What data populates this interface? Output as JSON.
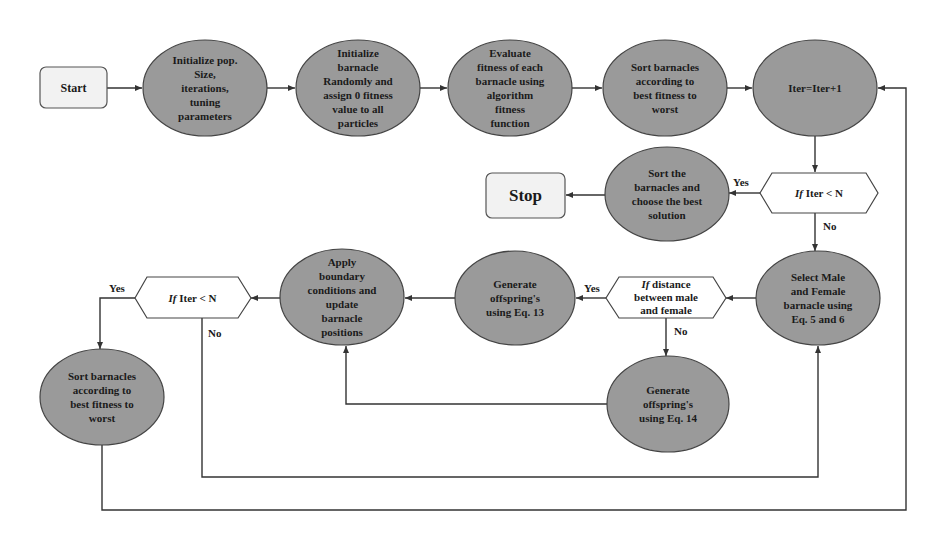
{
  "diagram": {
    "type": "flowchart",
    "colors": {
      "process_fill": "#9a9a9a",
      "terminal_fill": "#f2f2f2",
      "decision_fill": "#ffffff",
      "stroke": "#333333"
    },
    "nodes": {
      "start": {
        "label": "Start",
        "shape": "rounded-rect"
      },
      "init_pop": {
        "label": "Initialize pop.\nSize,\niterations,\ntuning\nparameters",
        "shape": "ellipse"
      },
      "init_barnacle": {
        "label": "Initialize\nbarnacle\nRandomly and\nassign 0 fitness\nvalue to all\nparticles",
        "shape": "ellipse"
      },
      "evaluate": {
        "label": "Evaluate\nfitness of each\nbarnacle using\nalgorithm\nfitness\nfunction",
        "shape": "ellipse"
      },
      "sort_top": {
        "label": "Sort barnacles\naccording to\nbest fitness to\nworst",
        "shape": "ellipse"
      },
      "iter_inc": {
        "label": "Iter=Iter+1",
        "shape": "ellipse"
      },
      "cond_top": {
        "label_prefix": "If",
        "label": " Iter < N",
        "shape": "hexagon"
      },
      "sort_best": {
        "label": "Sort the\nbarnacles and\nchoose the best\nsolution",
        "shape": "ellipse"
      },
      "stop": {
        "label": "Stop",
        "shape": "rounded-rect"
      },
      "select": {
        "label": "Select Male\nand Female\nbarnacle using\nEq. 5 and 6",
        "shape": "ellipse"
      },
      "cond_distance": {
        "label_prefix": "If",
        "label": " distance\nbetween male\nand female",
        "shape": "hexagon"
      },
      "gen13": {
        "label": "Generate\noffspring's\nusing Eq. 13",
        "shape": "ellipse"
      },
      "gen14": {
        "label": "Generate\noffspring's\nusing Eq. 14",
        "shape": "ellipse"
      },
      "boundary": {
        "label": "Apply\nboundary\nconditions and\nupdate\nbarnacle\npositions",
        "shape": "ellipse"
      },
      "cond_left": {
        "label_prefix": "If",
        "label": " Iter < N",
        "shape": "hexagon"
      },
      "sort_left": {
        "label": "Sort barnacles\naccording to\nbest fitness to\nworst",
        "shape": "ellipse"
      }
    },
    "edge_labels": {
      "top_yes": "Yes",
      "top_no": "No",
      "dist_yes": "Yes",
      "dist_no": "No",
      "left_yes": "Yes",
      "left_no": "No"
    },
    "edges": [
      {
        "from": "start",
        "to": "init_pop"
      },
      {
        "from": "init_pop",
        "to": "init_barnacle"
      },
      {
        "from": "init_barnacle",
        "to": "evaluate"
      },
      {
        "from": "evaluate",
        "to": "sort_top"
      },
      {
        "from": "sort_top",
        "to": "iter_inc"
      },
      {
        "from": "iter_inc",
        "to": "cond_top"
      },
      {
        "from": "cond_top",
        "to": "sort_best",
        "label": "Yes"
      },
      {
        "from": "sort_best",
        "to": "stop"
      },
      {
        "from": "cond_top",
        "to": "select",
        "label": "No"
      },
      {
        "from": "select",
        "to": "cond_distance"
      },
      {
        "from": "cond_distance",
        "to": "gen13",
        "label": "Yes"
      },
      {
        "from": "cond_distance",
        "to": "gen14",
        "label": "No"
      },
      {
        "from": "gen13",
        "to": "boundary"
      },
      {
        "from": "gen14",
        "to": "boundary"
      },
      {
        "from": "boundary",
        "to": "cond_left"
      },
      {
        "from": "cond_left",
        "to": "sort_left",
        "label": "Yes"
      },
      {
        "from": "cond_left",
        "to": "select",
        "label": "No"
      },
      {
        "from": "sort_left",
        "to": "iter_inc"
      }
    ]
  }
}
